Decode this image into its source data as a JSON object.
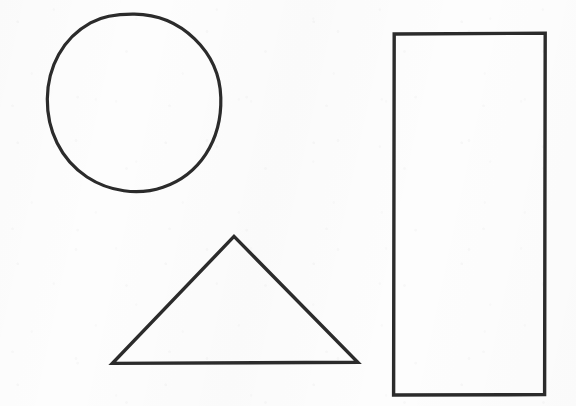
{
  "document": {
    "title": "Geometric Shapes Drawing",
    "medium": "hand-drawn ink on paper",
    "width": 576,
    "height": 406,
    "background_color": "#fdfdfd",
    "ink_color": "#2b2b2b"
  },
  "shapes": [
    {
      "id": "circle",
      "name": "circle",
      "label": "Circle",
      "stroke_color": "#2b2b2b",
      "stroke_width": 3.2,
      "fill": "none",
      "geometry": {
        "type": "ellipse",
        "cx": 134,
        "cy": 102,
        "rx": 87,
        "ry": 88
      },
      "bounds": {
        "x": 47,
        "y": 14,
        "width": 174,
        "height": 176
      }
    },
    {
      "id": "triangle",
      "name": "triangle",
      "label": "Triangle",
      "stroke_color": "#2b2b2b",
      "stroke_width": 3.4,
      "fill": "none",
      "geometry": {
        "type": "polygon",
        "points": "234,236 358,363 112,363"
      },
      "vertices": [
        {
          "label": "apex",
          "x": 234,
          "y": 236
        },
        {
          "label": "base-right",
          "x": 358,
          "y": 363
        },
        {
          "label": "base-left",
          "x": 112,
          "y": 363
        }
      ],
      "bounds": {
        "x": 112,
        "y": 236,
        "width": 246,
        "height": 127
      }
    },
    {
      "id": "rectangle",
      "name": "rectangle",
      "label": "Rectangle",
      "stroke_color": "#2b2b2b",
      "stroke_width": 3.4,
      "fill": "none",
      "geometry": {
        "type": "rect",
        "x": 394,
        "y": 34,
        "width": 151,
        "height": 361
      },
      "bounds": {
        "x": 394,
        "y": 34,
        "width": 151,
        "height": 361
      }
    }
  ]
}
